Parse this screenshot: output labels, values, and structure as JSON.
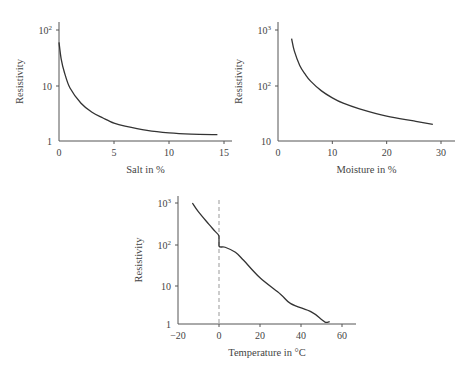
{
  "chart_data": [
    {
      "type": "line",
      "title": "",
      "xlabel": "Salt in %",
      "ylabel": "Resistivity",
      "yscale": "log",
      "xlim": [
        0,
        15
      ],
      "ylim": [
        1,
        100
      ],
      "xticks": [
        "0",
        "5",
        "10",
        "15"
      ],
      "yticks": [
        "1",
        "10",
        "10²"
      ],
      "grid": false,
      "x": [
        0,
        0.2,
        0.5,
        1,
        2,
        3,
        4,
        5,
        6,
        8,
        10,
        12,
        14.4
      ],
      "values": [
        60,
        30,
        17,
        9,
        4.8,
        3.3,
        2.6,
        2.1,
        1.85,
        1.55,
        1.4,
        1.33,
        1.3
      ]
    },
    {
      "type": "line",
      "title": "",
      "xlabel": "Moisture in %",
      "ylabel": "Resistivity",
      "yscale": "log",
      "xlim": [
        0,
        30
      ],
      "ylim": [
        10,
        1000
      ],
      "xticks": [
        "0",
        "10",
        "20",
        "30"
      ],
      "yticks": [
        "10",
        "10²",
        "10³"
      ],
      "grid": false,
      "x": [
        2.5,
        3,
        4,
        5,
        6,
        8,
        10,
        12,
        15,
        20,
        25,
        28.5
      ],
      "values": [
        700,
        420,
        230,
        160,
        120,
        80,
        60,
        48,
        38,
        28,
        23,
        20
      ]
    },
    {
      "type": "line",
      "title": "",
      "xlabel": "Temperature in °C",
      "ylabel": "Resistivity",
      "yscale": "log",
      "xlim": [
        -20,
        65
      ],
      "ylim": [
        1,
        1000
      ],
      "xticks": [
        "-20",
        "0",
        "20",
        "40",
        "60"
      ],
      "yticks": [
        "1",
        "10",
        "10²",
        "10³"
      ],
      "grid": false,
      "annotations": [
        "dashed vertical line at 0 °C (freezing point)"
      ],
      "x": [
        -13,
        -10,
        -5,
        -2,
        0,
        0,
        3,
        8,
        12,
        20,
        30,
        35,
        45,
        50,
        52,
        54
      ],
      "values": [
        1000,
        600,
        300,
        200,
        150,
        85,
        80,
        60,
        38,
        14,
        5.5,
        3.2,
        2.0,
        1.3,
        1.1,
        1.15
      ]
    }
  ]
}
